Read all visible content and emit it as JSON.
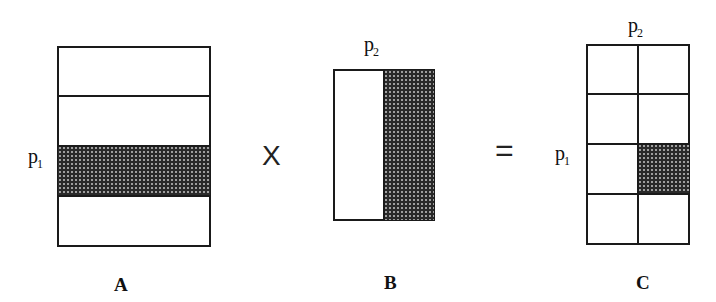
{
  "diagram": {
    "matrix_a": {
      "caption": "A",
      "row_label": "p",
      "row_label_sub": "1",
      "rows": 4,
      "cols": 1,
      "shaded_row": 3
    },
    "operator_multiply": "X",
    "matrix_b": {
      "caption": "B",
      "col_label": "p",
      "col_label_sub": "2",
      "rows": 1,
      "cols": 2,
      "shaded_col": 2
    },
    "operator_equals": "=",
    "matrix_c": {
      "caption": "C",
      "row_label": "p",
      "row_label_sub": "1",
      "col_label": "p",
      "col_label_sub": "2",
      "rows": 4,
      "cols": 2,
      "shaded_cell": [
        3,
        2
      ]
    },
    "colors": {
      "line": "#1a1a1a",
      "shade": "#2a2a2a",
      "background": "#ffffff"
    }
  }
}
